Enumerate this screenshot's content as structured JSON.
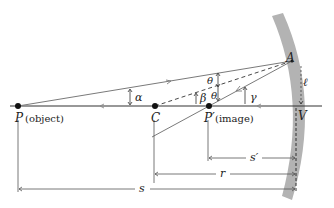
{
  "diagram": {
    "points": {
      "P": {
        "label": "P",
        "note": "(object)"
      },
      "C": {
        "label": "C"
      },
      "P_prime": {
        "label": "P′",
        "note": "(image)"
      },
      "V": {
        "label": "V"
      },
      "A": {
        "label": "A"
      }
    },
    "angles": {
      "alpha": "α",
      "beta": "β",
      "gamma": "γ",
      "theta_upper": "θ",
      "theta_lower": "θ"
    },
    "arc_length": "ℓ",
    "dimensions": {
      "s_prime": "s′",
      "r": "r",
      "s": "s"
    },
    "colors": {
      "mirror": "#b3b3b3",
      "rays": "#7a7a7a",
      "axis": "#333333",
      "points": "#111111"
    }
  }
}
